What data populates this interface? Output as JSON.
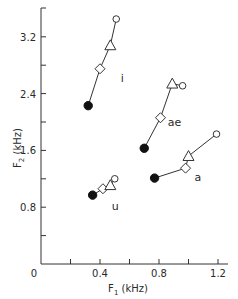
{
  "chart_data": {
    "type": "scatter",
    "title": "",
    "xlabel": "F1 (kHz)",
    "ylabel": "F2 (kHz)",
    "xlim": [
      0,
      1.25
    ],
    "ylim": [
      0,
      3.6
    ],
    "x_ticks": [
      0,
      0.2,
      0.4,
      0.6,
      0.8,
      1.0,
      1.2
    ],
    "x_tick_labels": [
      "0",
      "0.4",
      "0.8",
      "1.2"
    ],
    "y_ticks": [
      0,
      0.4,
      0.8,
      1.2,
      1.6,
      2.0,
      2.4,
      2.8,
      3.2
    ],
    "y_tick_labels": [
      "0.8",
      "1.6",
      "2.4",
      "3.2"
    ],
    "grid": false,
    "legend": null,
    "marker_order": [
      "filled-circle",
      "diamond",
      "triangle",
      "open-circle"
    ],
    "series": [
      {
        "name": "i",
        "points": [
          {
            "marker": "filled-circle",
            "x": 0.32,
            "y": 2.23
          },
          {
            "marker": "diamond",
            "x": 0.4,
            "y": 2.75
          },
          {
            "marker": "triangle",
            "x": 0.47,
            "y": 3.08
          },
          {
            "marker": "open-circle",
            "x": 0.51,
            "y": 3.45
          }
        ],
        "label_pos": {
          "x": 0.54,
          "y": 2.62
        }
      },
      {
        "name": "ae",
        "points": [
          {
            "marker": "filled-circle",
            "x": 0.7,
            "y": 1.63
          },
          {
            "marker": "diamond",
            "x": 0.81,
            "y": 2.06
          },
          {
            "marker": "triangle",
            "x": 0.89,
            "y": 2.54
          },
          {
            "marker": "open-circle",
            "x": 0.96,
            "y": 2.51
          }
        ],
        "label_pos": {
          "x": 0.86,
          "y": 2.0
        }
      },
      {
        "name": "a",
        "points": [
          {
            "marker": "filled-circle",
            "x": 0.77,
            "y": 1.21
          },
          {
            "marker": "diamond",
            "x": 0.98,
            "y": 1.35
          },
          {
            "marker": "triangle",
            "x": 1.0,
            "y": 1.52
          },
          {
            "marker": "open-circle",
            "x": 1.19,
            "y": 1.83
          }
        ],
        "label_pos": {
          "x": 1.04,
          "y": 1.22
        }
      },
      {
        "name": "u",
        "points": [
          {
            "marker": "filled-circle",
            "x": 0.35,
            "y": 0.97
          },
          {
            "marker": "diamond",
            "x": 0.42,
            "y": 1.06
          },
          {
            "marker": "triangle",
            "x": 0.47,
            "y": 1.11
          },
          {
            "marker": "open-circle",
            "x": 0.5,
            "y": 1.2
          }
        ],
        "label_pos": {
          "x": 0.48,
          "y": 0.82
        }
      }
    ]
  },
  "labels": {
    "x_axis": {
      "main": "F",
      "sub": "1",
      "unit": " (kHz)"
    },
    "y_axis": {
      "main": "F",
      "sub": "2",
      "unit": " (kHz)"
    },
    "origin": "0"
  }
}
